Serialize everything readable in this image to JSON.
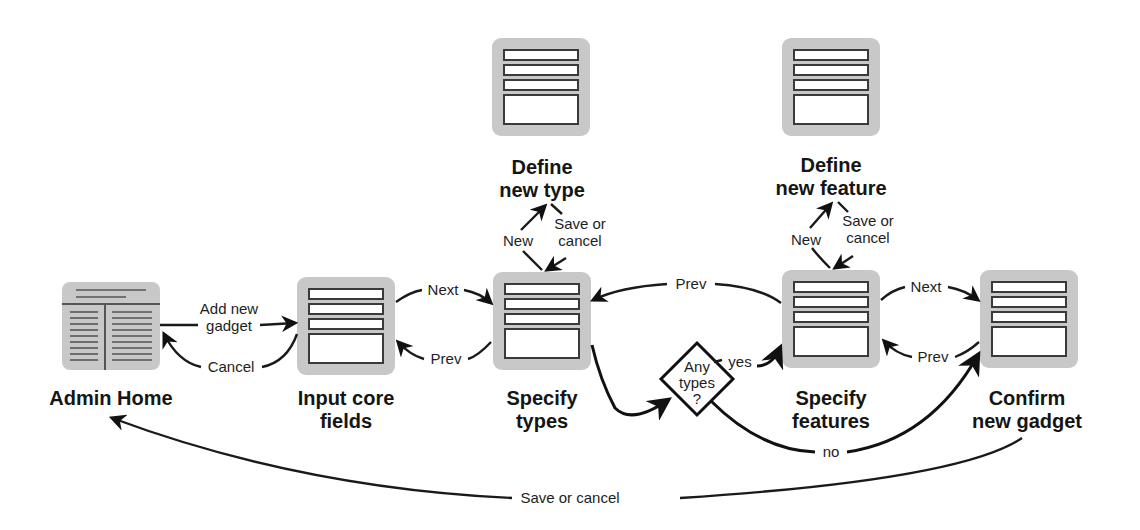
{
  "diagram": {
    "type": "flowchart",
    "nodes": {
      "admin_home": {
        "title": "Admin Home",
        "icon": "page-layout-icon"
      },
      "input_core": {
        "title_line1": "Input core",
        "title_line2": "fields",
        "icon": "form-icon"
      },
      "specify_types": {
        "title_line1": "Specify",
        "title_line2": "types",
        "icon": "form-icon"
      },
      "define_type": {
        "title_line1": "Define",
        "title_line2": "new type",
        "icon": "form-icon"
      },
      "specify_features": {
        "title_line1": "Specify",
        "title_line2": "features",
        "icon": "form-icon"
      },
      "define_feature": {
        "title_line1": "Define",
        "title_line2": "new feature",
        "icon": "form-icon"
      },
      "confirm": {
        "title_line1": "Confirm",
        "title_line2": "new gadget",
        "icon": "form-icon"
      },
      "decision": {
        "line1": "Any",
        "line2": "types",
        "line3": "?"
      }
    },
    "edges": {
      "add_new_gadget_1": "Add new",
      "add_new_gadget_2": "gadget",
      "cancel": "Cancel",
      "next_1": "Next",
      "prev_1": "Prev",
      "new_type": "New",
      "save_cancel_type_1": "Save or",
      "save_cancel_type_2": "cancel",
      "prev_features_to_types": "Prev",
      "new_feature": "New",
      "save_cancel_feature_1": "Save or",
      "save_cancel_feature_2": "cancel",
      "next_2": "Next",
      "prev_2": "Prev",
      "yes": "yes",
      "no": "no",
      "save_or_cancel_home": "Save or cancel"
    }
  }
}
